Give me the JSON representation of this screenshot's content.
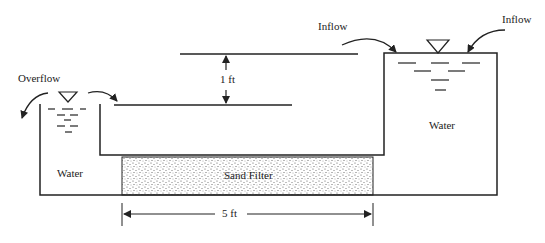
{
  "labels": {
    "overflow": "Overflow",
    "inflow_left": "Inflow",
    "inflow_right": "Inflow",
    "water_left": "Water",
    "water_right": "Water",
    "sand_filter": "Sand Filter",
    "head_difference": "1 ft",
    "filter_length": "5 ft"
  },
  "colors": {
    "line": "#222222",
    "background": "#ffffff",
    "sand_dots": "#555555"
  }
}
